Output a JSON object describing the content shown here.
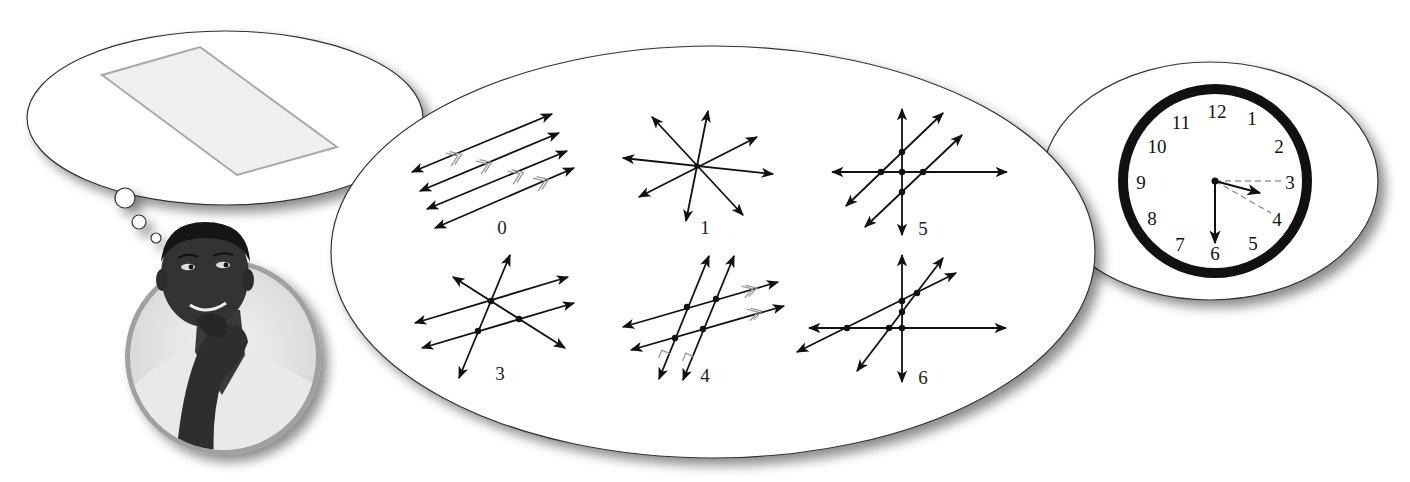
{
  "scene": {
    "description": "Person thinking about a parallelogram; bubble of four-line intersection diagrams; clock bubble"
  },
  "thought_bubble": {
    "shape": "parallelogram",
    "fill": "#efefef",
    "stroke": "#a8a8a8"
  },
  "person": {
    "frame_color": "#a0a0a0",
    "description": "man with hand on chin, thinking"
  },
  "diagrams": [
    {
      "label": "0",
      "caption": "four parallel lines, 0 intersections"
    },
    {
      "label": "1",
      "caption": "four concurrent lines, 1 intersection"
    },
    {
      "label": "5",
      "caption": "two parallel lines cut by a horizontal and vertical line, 5 intersections"
    },
    {
      "label": "3",
      "caption": "two parallel lines and two crossing lines through one point, 3 intersections"
    },
    {
      "label": "4",
      "caption": "two pairs of parallel lines, 4 intersections"
    },
    {
      "label": "6",
      "caption": "four lines in general position, 6 intersections"
    }
  ],
  "clock": {
    "numbers": [
      "12",
      "1",
      "2",
      "3",
      "4",
      "5",
      "6",
      "7",
      "8",
      "9",
      "10",
      "11"
    ],
    "time_shown": "3:30",
    "ring_color": "#111111",
    "guide_line_color": "#999999"
  },
  "colors": {
    "line": "#111111",
    "tick": "#999999",
    "bubble_stroke": "#333333",
    "shadow": "#9a9a9a"
  }
}
